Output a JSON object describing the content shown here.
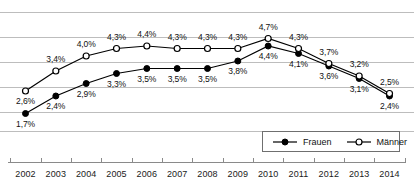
{
  "chart_data": {
    "type": "line",
    "title": "",
    "xlabel": "",
    "ylabel": "",
    "grid": true,
    "legend_position": "bottom-right",
    "categories": [
      "2002",
      "2003",
      "2004",
      "2005",
      "2006",
      "2007",
      "2008",
      "2009",
      "2010",
      "2011",
      "2012",
      "2013",
      "2014"
    ],
    "ylim": [
      0.75,
      5.75
    ],
    "gridline_values": [
      5.75,
      4.75,
      3.75,
      2.75,
      1.75,
      1.0
    ],
    "value_suffix": "%",
    "decimal_separator": ",",
    "series": [
      {
        "name": "Frauen",
        "marker": "filled-circle",
        "color": "#000000",
        "values": [
          1.7,
          2.4,
          2.9,
          3.3,
          3.5,
          3.5,
          3.5,
          3.8,
          4.4,
          4.1,
          3.6,
          3.1,
          2.4
        ],
        "labels": [
          "1,7%",
          "2,4%",
          "2,9%",
          "3,3%",
          "3,5%",
          "3,5%",
          "3,5%",
          "3,8%",
          "4,4%",
          "4,1%",
          "3,6%",
          "3,1%",
          "2,4%"
        ],
        "label_positions": [
          "below",
          "below",
          "below",
          "below",
          "below",
          "below",
          "below",
          "below",
          "below",
          "below",
          "below",
          "below",
          "below"
        ]
      },
      {
        "name": "Männer",
        "marker": "open-circle",
        "color": "#000000",
        "values": [
          2.6,
          3.4,
          4.0,
          4.3,
          4.4,
          4.3,
          4.3,
          4.3,
          4.7,
          4.3,
          3.7,
          3.2,
          2.5
        ],
        "labels": [
          "2,6%",
          "3,4%",
          "4,0%",
          "4,3%",
          "4,4%",
          "4,3%",
          "4,3%",
          "4,3%",
          "4,7%",
          "4,3%",
          "3,7%",
          "3,2%",
          "2,5%"
        ],
        "label_positions": [
          "below",
          "above",
          "above",
          "above",
          "above",
          "above",
          "above",
          "above",
          "above",
          "above",
          "above",
          "above",
          "above"
        ]
      }
    ]
  },
  "legend": {
    "items": [
      {
        "label": "Frauen",
        "marker": "filled-circle"
      },
      {
        "label": "Männer",
        "marker": "open-circle"
      }
    ]
  },
  "colors": {
    "gridline": "#bdbdbd",
    "axis": "#8a8a8a",
    "series_line": "#000000",
    "text": "#111111",
    "background": "#ffffff"
  }
}
